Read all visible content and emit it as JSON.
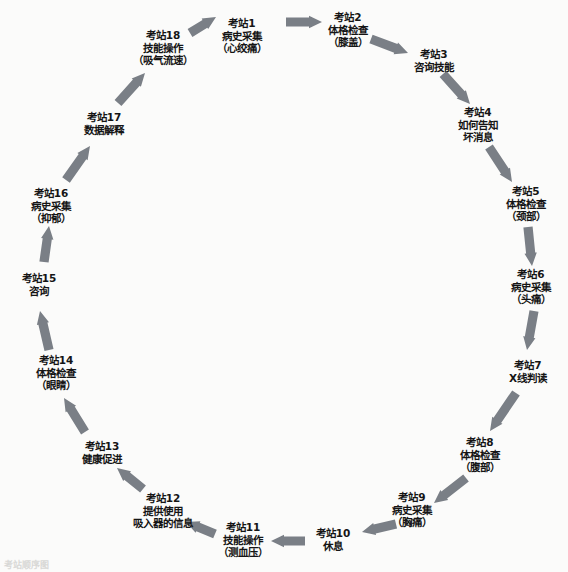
{
  "diagram": {
    "type": "circular-flow",
    "title": "",
    "arrow_color": "#7a7f86",
    "text_color": "#151515",
    "background_color": "#fbfbfa",
    "direction": "clockwise",
    "node_count": 18,
    "nodes": [
      {
        "id": 1,
        "lines": [
          "考站1",
          "病史采集",
          "（心绞痛）"
        ],
        "x": 242,
        "y": 36
      },
      {
        "id": 2,
        "lines": [
          "考站2",
          "体格检查",
          "（膝盖）"
        ],
        "x": 348,
        "y": 30
      },
      {
        "id": 3,
        "lines": [
          "考站3",
          "咨询技能"
        ],
        "x": 434,
        "y": 61
      },
      {
        "id": 4,
        "lines": [
          "考站4",
          "如何告知",
          "坏消息"
        ],
        "x": 478,
        "y": 125
      },
      {
        "id": 5,
        "lines": [
          "考站5",
          "体格检查",
          "（颈部）"
        ],
        "x": 526,
        "y": 204
      },
      {
        "id": 6,
        "lines": [
          "考站6",
          "病史采集",
          "（头痛）"
        ],
        "x": 531,
        "y": 287
      },
      {
        "id": 7,
        "lines": [
          "考站7",
          "X线判读"
        ],
        "x": 528,
        "y": 372
      },
      {
        "id": 8,
        "lines": [
          "考站8",
          "体格检查",
          "（腹部）"
        ],
        "x": 480,
        "y": 455
      },
      {
        "id": 9,
        "lines": [
          "考站9",
          "病史采集",
          "（胸痛）"
        ],
        "x": 412,
        "y": 510
      },
      {
        "id": 10,
        "lines": [
          "考站10",
          "休息"
        ],
        "x": 333,
        "y": 540
      },
      {
        "id": 11,
        "lines": [
          "考站11",
          "技能操作",
          "（测血压）"
        ],
        "x": 243,
        "y": 540
      },
      {
        "id": 12,
        "lines": [
          "考站12",
          "提供使用",
          "吸入器的信息"
        ],
        "x": 163,
        "y": 511
      },
      {
        "id": 13,
        "lines": [
          "考站13",
          "健康促进"
        ],
        "x": 102,
        "y": 453
      },
      {
        "id": 14,
        "lines": [
          "考站14",
          "体格检查",
          "（眼睛）"
        ],
        "x": 56,
        "y": 373
      },
      {
        "id": 15,
        "lines": [
          "考站15",
          "咨询"
        ],
        "x": 39,
        "y": 285
      },
      {
        "id": 16,
        "lines": [
          "考站16",
          "病史采集",
          "（抑郁）"
        ],
        "x": 51,
        "y": 206
      },
      {
        "id": 17,
        "lines": [
          "考站17",
          "数据解释"
        ],
        "x": 104,
        "y": 124
      },
      {
        "id": 18,
        "lines": [
          "考站18",
          "技能操作",
          "（吸气流速）"
        ],
        "x": 163,
        "y": 48
      }
    ],
    "edges": [
      {
        "from": 1,
        "to": 2,
        "x1": 286,
        "y1": 22,
        "x2": 322,
        "y2": 22
      },
      {
        "from": 2,
        "to": 3,
        "x1": 371,
        "y1": 39,
        "x2": 408,
        "y2": 53
      },
      {
        "from": 3,
        "to": 4,
        "x1": 443,
        "y1": 74,
        "x2": 470,
        "y2": 104
      },
      {
        "from": 4,
        "to": 5,
        "x1": 489,
        "y1": 147,
        "x2": 512,
        "y2": 182
      },
      {
        "from": 5,
        "to": 6,
        "x1": 528,
        "y1": 227,
        "x2": 532,
        "y2": 266
      },
      {
        "from": 6,
        "to": 7,
        "x1": 534,
        "y1": 311,
        "x2": 527,
        "y2": 350
      },
      {
        "from": 7,
        "to": 8,
        "x1": 516,
        "y1": 393,
        "x2": 490,
        "y2": 431
      },
      {
        "from": 8,
        "to": 9,
        "x1": 466,
        "y1": 478,
        "x2": 434,
        "y2": 503
      },
      {
        "from": 9,
        "to": 10,
        "x1": 396,
        "y1": 524,
        "x2": 362,
        "y2": 532
      },
      {
        "from": 10,
        "to": 11,
        "x1": 305,
        "y1": 541,
        "x2": 271,
        "y2": 541
      },
      {
        "from": 11,
        "to": 12,
        "x1": 215,
        "y1": 534,
        "x2": 186,
        "y2": 522
      },
      {
        "from": 12,
        "to": 13,
        "x1": 143,
        "y1": 489,
        "x2": 117,
        "y2": 468
      },
      {
        "from": 13,
        "to": 14,
        "x1": 85,
        "y1": 432,
        "x2": 64,
        "y2": 398
      },
      {
        "from": 14,
        "to": 15,
        "x1": 49,
        "y1": 350,
        "x2": 40,
        "y2": 311
      },
      {
        "from": 15,
        "to": 16,
        "x1": 44,
        "y1": 262,
        "x2": 49,
        "y2": 226
      },
      {
        "from": 16,
        "to": 17,
        "x1": 66,
        "y1": 180,
        "x2": 90,
        "y2": 146
      },
      {
        "from": 17,
        "to": 18,
        "x1": 118,
        "y1": 103,
        "x2": 145,
        "y2": 73
      },
      {
        "from": 18,
        "to": 1,
        "x1": 190,
        "y1": 33,
        "x2": 216,
        "y2": 17
      }
    ],
    "footnote": "考站顺序图"
  }
}
